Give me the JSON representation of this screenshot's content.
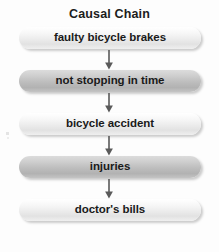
{
  "diagram": {
    "title": "Causal Chain",
    "type": "flowchart-vertical-chain",
    "background_color": "#fdfdfd",
    "text_color": "#1a1a1a",
    "light_fill": "#ececec",
    "dark_fill": "#bdbdbd",
    "arrow_color": "#5a5a5a",
    "nodes": [
      {
        "label": "faulty bicycle brakes",
        "style": "light"
      },
      {
        "label": "not stopping in time",
        "style": "dark"
      },
      {
        "label": "bicycle accident",
        "style": "light"
      },
      {
        "label": "injuries",
        "style": "dark"
      },
      {
        "label": "doctor's bills",
        "style": "light"
      }
    ],
    "connectors": [
      {
        "from": "faulty bicycle brakes",
        "to": "not stopping in time",
        "icon": "arrow-down-icon"
      },
      {
        "from": "not stopping in time",
        "to": "bicycle accident",
        "icon": "arrow-down-icon"
      },
      {
        "from": "bicycle accident",
        "to": "injuries",
        "icon": "arrow-down-icon"
      },
      {
        "from": "injuries",
        "to": "doctor's bills",
        "icon": "arrow-down-icon"
      }
    ]
  }
}
